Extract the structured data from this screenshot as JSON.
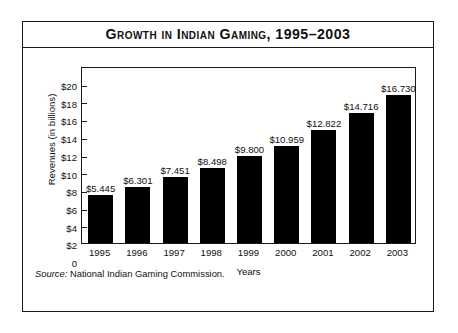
{
  "figure": {
    "title": "Growth in Indian Gaming, 1995–2003",
    "source_lead": "Source:",
    "source_text": "National Indian Gaming Commission."
  },
  "chart_data": {
    "type": "bar",
    "title": "Growth in Indian Gaming, 1995–2003",
    "xlabel": "Years",
    "ylabel": "Revenues (in billions)",
    "ylim": [
      0,
      20
    ],
    "ytick_labels": [
      "$20",
      "$18",
      "$16",
      "$14",
      "$12",
      "$10",
      "$8",
      "$6",
      "$4",
      "$2",
      "0"
    ],
    "ytick_values": [
      20,
      18,
      16,
      14,
      12,
      10,
      8,
      6,
      4,
      2,
      0
    ],
    "grid": false,
    "legend": null,
    "bar_color": "#000000",
    "categories": [
      "1995",
      "1996",
      "1997",
      "1998",
      "1999",
      "2000",
      "2001",
      "2002",
      "2003"
    ],
    "values": [
      5.445,
      6.301,
      7.451,
      8.498,
      9.8,
      10.959,
      12.822,
      14.716,
      16.73
    ],
    "value_labels": [
      "$5.445",
      "$6.301",
      "$7.451",
      "$8.498",
      "$9.800",
      "$10.959",
      "$12.822",
      "$14.716",
      "$16.730"
    ]
  }
}
